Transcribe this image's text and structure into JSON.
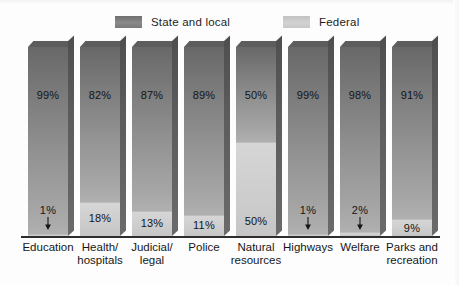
{
  "chart_data": {
    "type": "bar",
    "title": "",
    "subtitle": "",
    "xlabel": "",
    "ylabel": "",
    "ylim": [
      0,
      100
    ],
    "grid": false,
    "stacked": true,
    "orientation": "vertical",
    "legend_position": "top",
    "value_suffix": "%",
    "categories": [
      "Education",
      "Health/\nhospitals",
      "Judicial/\nlegal",
      "Police",
      "Natural\nresources",
      "Highways",
      "Welfare",
      "Parks and\nrecreation"
    ],
    "series": [
      {
        "name": "State and local",
        "color": "#8a8a8a",
        "values": [
          99,
          82,
          87,
          89,
          50,
          99,
          98,
          91
        ],
        "labels": [
          "99%",
          "82%",
          "87%",
          "89%",
          "50%",
          "99%",
          "98%",
          "91%"
        ]
      },
      {
        "name": "Federal",
        "color": "#cfcfcf",
        "values": [
          1,
          18,
          13,
          11,
          50,
          1,
          2,
          9
        ],
        "labels": [
          "1%",
          "18%",
          "13%",
          "11%",
          "50%",
          "1%",
          "2%",
          "9%"
        ]
      }
    ]
  },
  "legend": {
    "items": [
      {
        "label": "State and local",
        "swatch": "state",
        "color": "#8a8a8a"
      },
      {
        "label": "Federal",
        "swatch": "federal",
        "color": "#cfcfcf"
      }
    ]
  },
  "bars": [
    {
      "category": "Education",
      "category_lines": "Education",
      "state_value": 99,
      "federal_value": 1,
      "state_label": "99%",
      "federal_label": "1%",
      "federal_label_outside": true,
      "x": 28,
      "width": 40
    },
    {
      "category": "Health/hospitals",
      "category_lines": "Health/\nhospitals",
      "state_value": 82,
      "federal_value": 18,
      "state_label": "82%",
      "federal_label": "18%",
      "federal_label_outside": false,
      "x": 80,
      "width": 40
    },
    {
      "category": "Judicial/legal",
      "category_lines": "Judicial/\nlegal",
      "state_value": 87,
      "federal_value": 13,
      "state_label": "87%",
      "federal_label": "13%",
      "federal_label_outside": false,
      "x": 132,
      "width": 40
    },
    {
      "category": "Police",
      "category_lines": "Police",
      "state_value": 89,
      "federal_value": 11,
      "state_label": "89%",
      "federal_label": "11%",
      "federal_label_outside": false,
      "x": 184,
      "width": 40
    },
    {
      "category": "Natural resources",
      "category_lines": "Natural\nresources",
      "state_value": 50,
      "federal_value": 50,
      "state_label": "50%",
      "federal_label": "50%",
      "federal_label_outside": false,
      "x": 236,
      "width": 40
    },
    {
      "category": "Highways",
      "category_lines": "Highways",
      "state_value": 99,
      "federal_value": 1,
      "state_label": "99%",
      "federal_label": "1%",
      "federal_label_outside": true,
      "x": 288,
      "width": 40
    },
    {
      "category": "Welfare",
      "category_lines": "Welfare",
      "state_value": 98,
      "federal_value": 2,
      "state_label": "98%",
      "federal_label": "2%",
      "federal_label_outside": true,
      "x": 340,
      "width": 40
    },
    {
      "category": "Parks and recreation",
      "category_lines": "Parks and\nrecreation",
      "state_value": 91,
      "federal_value": 9,
      "state_label": "91%",
      "federal_label": "9%",
      "federal_label_outside": false,
      "x": 392,
      "width": 40
    }
  ],
  "axis": {
    "baseline_visible": true,
    "baseline_color": "#2e2e2e"
  }
}
